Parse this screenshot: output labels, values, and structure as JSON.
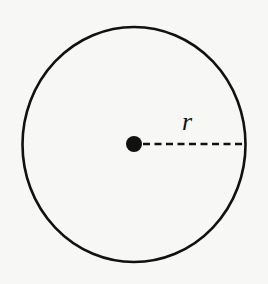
{
  "diagram": {
    "title": "",
    "shape": "circle",
    "center": {
      "x": 134,
      "y": 144.5
    },
    "radius_x": 111.5,
    "radius_y": 117.5,
    "stroke_color": "#111111",
    "background": "#f7f7f5",
    "center_point": {
      "x": 134,
      "y": 144,
      "r": 8
    },
    "radius_line": {
      "x1": 143,
      "y1": 144,
      "x2": 245,
      "y2": 144,
      "style": "dashed"
    },
    "labels": {
      "radius": "r"
    }
  }
}
